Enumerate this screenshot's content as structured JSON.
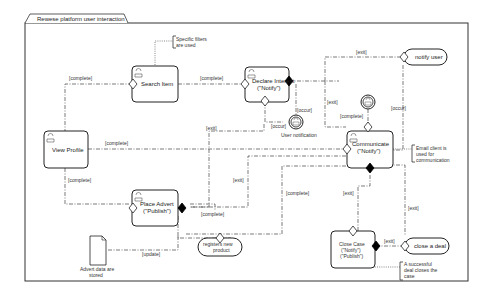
{
  "frame": {
    "title": "Rewese platform user interaction"
  },
  "activities": {
    "search_item": {
      "label": "Search Item"
    },
    "declare_interest": {
      "line1": "Declare Interest",
      "line2": "(\"Notify\")"
    },
    "view_profile": {
      "label": "View Profile"
    },
    "communicate": {
      "line1": "Communicate",
      "line2": "(\"Notify\")"
    },
    "place_advert": {
      "line1": "Place Advert",
      "line2": "(\"Publish\")"
    },
    "close_case": {
      "line1": "Close Case",
      "line2": "(\"Notify\")",
      "line3": "(\"Publish\")"
    }
  },
  "events": {
    "notify_user": "notify user",
    "close_a_deal": "close a deal",
    "registers_new_product": {
      "line1": "registers new",
      "line2": "product"
    },
    "user_notification": "User notification"
  },
  "notes": {
    "specific_filters": {
      "line1": "Specific filters",
      "line2": "are used"
    },
    "email_client": {
      "line1": "Email client is",
      "line2": "used for",
      "line3": "communication"
    },
    "successful_deal": {
      "line1": "A successful",
      "line2": "deal closes the",
      "line3": "case"
    },
    "advert_data": {
      "line1": "Advert data are",
      "line2": "stored"
    }
  },
  "edge_labels": {
    "vp_to_search": "[complete]",
    "search_to_declare": "[complete]",
    "vp_to_communicate": "[complete]",
    "vp_to_advert": "[complete]",
    "declare_exit": "[exit]",
    "declare_occur1": "[occur]",
    "declare_occur2": "[occur]",
    "declare_to_comm_exit": "[exit]",
    "notify_exit": "[exit]",
    "notify_occur": "[occur]",
    "comm_complete": "[complete]",
    "advert_exit": "[exit]",
    "advert_complete": "[complete]",
    "advert_complete2": "[complete]",
    "advert_update": "[update]",
    "comm_exit": "[exit]",
    "comm_exit2": "[exit]",
    "close_exit": "[exit]"
  },
  "colors": {
    "line": "#444444",
    "shape_stroke": "#222222",
    "background": "#ffffff"
  }
}
